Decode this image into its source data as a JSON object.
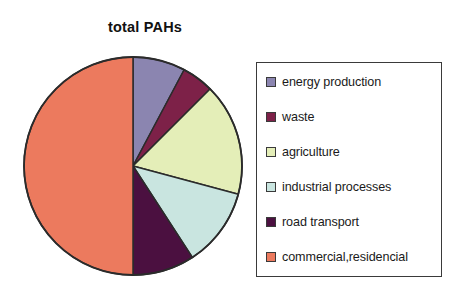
{
  "chart_data": {
    "type": "pie",
    "title": "total PAHs",
    "xlabel": "",
    "ylabel": "",
    "legend_position": "right",
    "grid": false,
    "categories": [
      "energy production",
      "waste",
      "agriculture",
      "industrial processes",
      "road transport",
      "commercial,residencial"
    ],
    "values": [
      7.8,
      4.7,
      16.7,
      11.7,
      9.1,
      50.0
    ],
    "units": "percent",
    "start_angle_deg": 0,
    "direction": "clockwise",
    "slice_angles_deg": [
      28,
      17,
      60,
      42,
      33,
      180
    ],
    "colors": [
      "#8b85b0",
      "#7d2148",
      "#e4eeb8",
      "#c9e5e0",
      "#4b1040",
      "#ec7a5e"
    ],
    "outline_color": "#2b2b2b",
    "slices": [
      {
        "label": "energy production",
        "value": 7.8,
        "color": "#8b85b0",
        "angle_deg": 28
      },
      {
        "label": "waste",
        "value": 4.7,
        "color": "#7d2148",
        "angle_deg": 17
      },
      {
        "label": "agriculture",
        "value": 16.7,
        "color": "#e4eeb8",
        "angle_deg": 60
      },
      {
        "label": "industrial processes",
        "value": 11.7,
        "color": "#c9e5e0",
        "angle_deg": 42
      },
      {
        "label": "road transport",
        "value": 9.1,
        "color": "#4b1040",
        "angle_deg": 33
      },
      {
        "label": "commercial,residencial",
        "value": 50.0,
        "color": "#ec7a5e",
        "angle_deg": 180
      }
    ]
  },
  "legend": {
    "items": [
      {
        "label": "energy production",
        "color": "#8b85b0"
      },
      {
        "label": "waste",
        "color": "#7d2148"
      },
      {
        "label": "agriculture",
        "color": "#e4eeb8"
      },
      {
        "label": "industrial processes",
        "color": "#c9e5e0"
      },
      {
        "label": "road transport",
        "color": "#4b1040"
      },
      {
        "label": "commercial,residencial",
        "color": "#ec7a5e"
      }
    ]
  }
}
